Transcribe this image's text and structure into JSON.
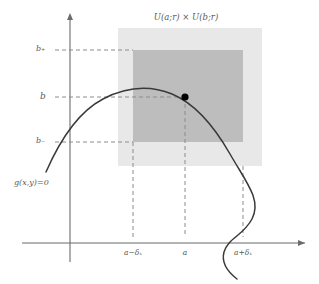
{
  "figure": {
    "title": "U(a;r) × U(b;r)",
    "curve_label": "g(x,y)=0",
    "axis_labels": {
      "y": [
        "b₊",
        "b",
        "b₋"
      ],
      "x": [
        "a−δₓ",
        "a",
        "a+δₓ"
      ]
    },
    "y_ticks": [
      {
        "label": "b₊",
        "pixel_y": 50
      },
      {
        "label": "b",
        "pixel_y": 97
      },
      {
        "label": "b₋",
        "pixel_y": 142
      }
    ],
    "x_ticks": [
      {
        "label": "a−δₓ",
        "pixel_x": 133
      },
      {
        "label": "a",
        "pixel_x": 185
      },
      {
        "label": "a+δₓ",
        "pixel_x": 243
      }
    ],
    "point": {
      "name": "(a,b)",
      "x": 185,
      "y": 97
    },
    "outer_rect": {
      "x": 118,
      "y": 28,
      "width": 144,
      "height": 138
    },
    "inner_rect": {
      "x": 133,
      "y": 50,
      "width": 110,
      "height": 92
    },
    "colors": {
      "outer_fill": "#e8e8e8",
      "inner_fill": "#bdbdbd",
      "curve": "#3a3a3a",
      "axis": "#6b6b6b",
      "dashed": "#8c8c8c",
      "text": "#5a5a5a",
      "point": "#000000"
    },
    "axes": {
      "y_axis_x": 70,
      "x_axis_y": 243,
      "y_axis_top": 13,
      "x_axis_right": 307
    },
    "curve_path": "M 46 172 C 60 140, 78 112, 103 99 C 128 86, 152 86, 172 94 C 196 104, 214 126, 230 154 C 246 182, 262 200, 252 219 C 243 236, 228 238, 224 252 C 221 263, 228 272, 237 279"
  }
}
